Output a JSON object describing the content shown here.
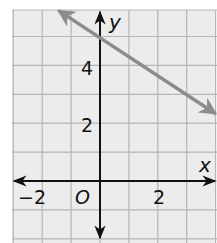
{
  "chart_data": {
    "type": "line",
    "title": "",
    "xlabel": "x",
    "ylabel": "y",
    "origin_label": "O",
    "xlim": [
      -3,
      4
    ],
    "ylim": [
      -2,
      6
    ],
    "grid": true,
    "x_tick_labels": [
      {
        "value": -2,
        "text": "−2"
      },
      {
        "value": 2,
        "text": "2"
      }
    ],
    "y_tick_labels": [
      {
        "value": 2,
        "text": "2"
      },
      {
        "value": 4,
        "text": "4"
      }
    ],
    "series": [
      {
        "name": "line",
        "equation": "y = -2/3 x + 5",
        "slope": -0.6667,
        "y_intercept": 5,
        "points": [
          [
            -1.5,
            6
          ],
          [
            0,
            5
          ],
          [
            3,
            3
          ],
          [
            4,
            2.33
          ]
        ],
        "color": "#8c8c8c",
        "arrows": "both"
      }
    ]
  },
  "colors": {
    "grid_bg": "#ececec",
    "grid_line": "#b5b5b5",
    "axis": "#111111",
    "line": "#8c8c8c"
  }
}
